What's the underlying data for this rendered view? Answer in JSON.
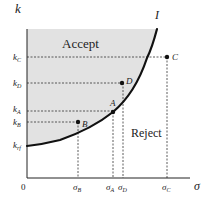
{
  "diagram": {
    "y_axis_label": "k",
    "x_axis_label": "σ",
    "origin_label": "0",
    "curve_label": "I",
    "regions": {
      "accept": "Accept",
      "reject": "Reject"
    },
    "y_ticks": [
      {
        "main": "k",
        "sub": "C"
      },
      {
        "main": "k",
        "sub": "D"
      },
      {
        "main": "k",
        "sub": "A"
      },
      {
        "main": "k",
        "sub": "B"
      },
      {
        "main": "k",
        "sub": "rf"
      }
    ],
    "x_ticks": [
      {
        "main": "σ",
        "sub": "B"
      },
      {
        "main": "σ",
        "sub": "A"
      },
      {
        "main": "σ",
        "sub": "D"
      },
      {
        "main": "σ",
        "sub": "C"
      }
    ],
    "points": [
      {
        "name": "A",
        "position": "on curve"
      },
      {
        "name": "B",
        "position": "accept region"
      },
      {
        "name": "C",
        "position": "reject region"
      },
      {
        "name": "D",
        "position": "accept region"
      }
    ],
    "colors": {
      "accept_fill": "#e2e2e2",
      "curve": "#111111",
      "guide": "#333333"
    }
  }
}
